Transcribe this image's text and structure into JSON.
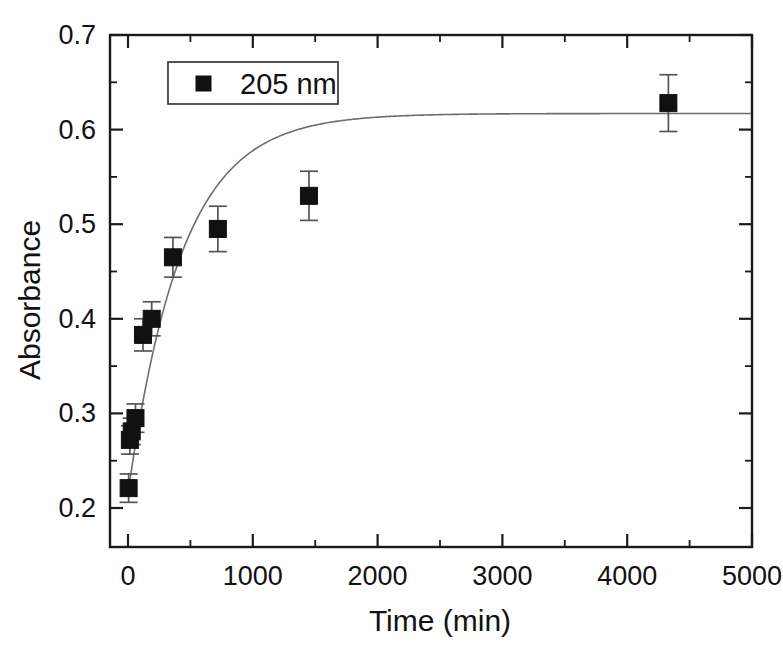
{
  "chart_data": {
    "type": "scatter",
    "title": "",
    "xlabel": "Time (min)",
    "ylabel": "Absorbance",
    "xlim": [
      0,
      5000
    ],
    "ylim": [
      0.2,
      0.7
    ],
    "grid": false,
    "legend_position": "top-left-inside",
    "x_ticks": [
      0,
      1000,
      2000,
      3000,
      4000,
      5000
    ],
    "x_tick_labels": [
      "0",
      "1000",
      "2000",
      "3000",
      "4000",
      "5000"
    ],
    "x_minor_step": 500,
    "y_ticks": [
      0.2,
      0.3,
      0.4,
      0.5,
      0.6,
      0.7
    ],
    "y_tick_labels": [
      "0.2",
      "0.3",
      "0.4",
      "0.5",
      "0.6",
      "0.7"
    ],
    "y_minor_step": 0.05,
    "series": [
      {
        "name": "205 nm",
        "marker": "filled-square",
        "color": "#111111",
        "x": [
          5,
          15,
          30,
          60,
          120,
          190,
          360,
          720,
          1450,
          4330
        ],
        "y": [
          0.221,
          0.272,
          0.281,
          0.295,
          0.383,
          0.4,
          0.465,
          0.495,
          0.53,
          0.628
        ],
        "yerr": [
          0.015,
          0.015,
          0.014,
          0.015,
          0.017,
          0.018,
          0.021,
          0.024,
          0.026,
          0.03
        ]
      }
    ],
    "fit_curve": {
      "name": "exponential-rise-fit",
      "color": "#6e6e6e",
      "model": "A0 + (Amax - A0) * (1 - exp(-t / tau))",
      "A0": 0.215,
      "Amax": 0.617,
      "tau": 430
    }
  },
  "legend": {
    "entries": [
      {
        "label": "205 nm",
        "marker": "filled-square"
      }
    ]
  },
  "axes": {
    "x_title": "Time (min)",
    "y_title": "Absorbance"
  }
}
